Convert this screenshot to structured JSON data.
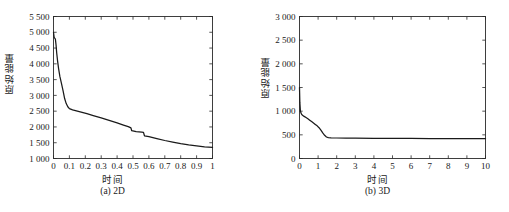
{
  "figure": {
    "panels": [
      {
        "id": "panel-a",
        "caption": "(a) 2D",
        "xlabel": "时间",
        "ylabel": "原始能量",
        "x_ticks": [
          "0",
          "0.1",
          "0.2",
          "0.3",
          "0.4",
          "0.5",
          "0.6",
          "0.7",
          "0.8",
          "0.9",
          "1"
        ],
        "y_ticks": [
          "1 000",
          "1 500",
          "2 000",
          "2 500",
          "3 000",
          "3 500",
          "4 000",
          "4 500",
          "5 000",
          "5 500"
        ]
      },
      {
        "id": "panel-b",
        "caption": "(b) 3D",
        "xlabel": "时间",
        "ylabel": "原始能量",
        "x_ticks": [
          "0",
          "1",
          "2",
          "3",
          "4",
          "5",
          "6",
          "7",
          "8",
          "9",
          "10"
        ],
        "y_ticks": [
          "0",
          "500",
          "1 000",
          "1 500",
          "2 000",
          "2 500",
          "3 000"
        ]
      }
    ]
  },
  "chart_data": [
    {
      "type": "line",
      "title": "(a) 2D",
      "xlabel": "时间",
      "ylabel": "原始能量",
      "xlim": [
        0,
        1
      ],
      "ylim": [
        1000,
        5500
      ],
      "xticks": [
        0,
        0.1,
        0.2,
        0.3,
        0.4,
        0.5,
        0.6,
        0.7,
        0.8,
        0.9,
        1
      ],
      "yticks": [
        1000,
        1500,
        2000,
        2500,
        3000,
        3500,
        4000,
        4500,
        5000,
        5500
      ],
      "grid": false,
      "legend": null,
      "series": [
        {
          "name": "原始能量",
          "color": "#1a1a1a",
          "x": [
            0.0,
            0.004,
            0.008,
            0.012,
            0.016,
            0.02,
            0.026,
            0.032,
            0.04,
            0.05,
            0.06,
            0.07,
            0.08,
            0.09,
            0.1,
            0.12,
            0.15,
            0.18,
            0.21,
            0.25,
            0.3,
            0.35,
            0.4,
            0.44,
            0.47,
            0.487,
            0.492,
            0.52,
            0.555,
            0.566,
            0.572,
            0.6,
            0.65,
            0.7,
            0.75,
            0.8,
            0.85,
            0.9,
            0.95,
            1.0
          ],
          "y": [
            5000,
            4840,
            4810,
            4780,
            4600,
            4350,
            4080,
            3850,
            3600,
            3380,
            3150,
            2900,
            2740,
            2640,
            2580,
            2540,
            2500,
            2460,
            2420,
            2360,
            2290,
            2210,
            2130,
            2060,
            2010,
            1970,
            1880,
            1850,
            1835,
            1830,
            1720,
            1690,
            1630,
            1570,
            1520,
            1470,
            1430,
            1400,
            1370,
            1350
          ]
        }
      ]
    },
    {
      "type": "line",
      "title": "(b) 3D",
      "xlabel": "时间",
      "ylabel": "原始能量",
      "xlim": [
        0,
        10
      ],
      "ylim": [
        0,
        3000
      ],
      "xticks": [
        0,
        1,
        2,
        3,
        4,
        5,
        6,
        7,
        8,
        9,
        10
      ],
      "yticks": [
        0,
        500,
        1000,
        1500,
        2000,
        2500,
        3000
      ],
      "grid": false,
      "legend": null,
      "series": [
        {
          "name": "原始能量",
          "color": "#1a1a1a",
          "x": [
            0.0,
            0.02,
            0.05,
            0.08,
            0.12,
            0.18,
            0.25,
            0.35,
            0.45,
            0.55,
            0.65,
            0.75,
            0.85,
            0.95,
            1.05,
            1.15,
            1.25,
            1.35,
            1.45,
            1.55,
            1.7,
            2.0,
            2.5,
            3.0,
            4.0,
            5.0,
            6.0,
            7.0,
            8.0,
            9.0,
            10.0
          ],
          "y": [
            1500,
            1180,
            1000,
            960,
            930,
            910,
            890,
            865,
            840,
            810,
            780,
            750,
            720,
            690,
            650,
            600,
            540,
            490,
            455,
            440,
            435,
            433,
            430,
            428,
            426,
            424,
            423,
            422,
            421,
            420,
            418
          ]
        }
      ]
    }
  ]
}
